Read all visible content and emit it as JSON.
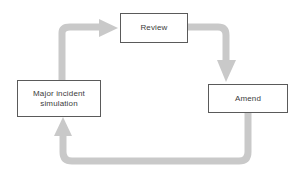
{
  "diagram": {
    "type": "cyclical-process-flow",
    "background_color": "#ffffff",
    "arrow_color": "#c9c9c9",
    "box_border_color": "#5a5a5a",
    "box_fill_color": "#ffffff",
    "text_color": "#3c3c3c",
    "nodes": [
      {
        "id": "review",
        "label": "Review",
        "shape": "rectangle",
        "x": 120,
        "y": 13,
        "width": 68,
        "height": 30
      },
      {
        "id": "amend",
        "label": "Amend",
        "shape": "rectangle",
        "x": 208,
        "y": 84,
        "width": 80,
        "height": 29
      },
      {
        "id": "simulation",
        "label": "Major incident\nsimulation",
        "shape": "rectangle",
        "x": 17,
        "y": 80,
        "width": 84,
        "height": 37
      }
    ],
    "connectors": [
      {
        "id": "simulation-to-review",
        "from": "simulation",
        "to": "review",
        "arrowhead": "right",
        "style": "rounded-elbow"
      },
      {
        "id": "review-to-amend",
        "from": "review",
        "to": "amend",
        "arrowhead": "down",
        "style": "rounded-elbow"
      },
      {
        "id": "amend-to-simulation",
        "from": "amend",
        "to": "simulation",
        "arrowhead": "up",
        "style": "rounded-elbow"
      }
    ]
  }
}
